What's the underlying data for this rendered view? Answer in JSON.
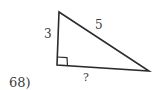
{
  "problem": {
    "number_label": "68)",
    "figure": {
      "type": "right-triangle",
      "side_left_label": "3",
      "hypotenuse_label": "5",
      "base_label": "?",
      "right_angle_marker": "square"
    }
  },
  "colors": {
    "line": "#2b2b2b",
    "text": "#3a3a3a",
    "background": "#ffffff"
  }
}
